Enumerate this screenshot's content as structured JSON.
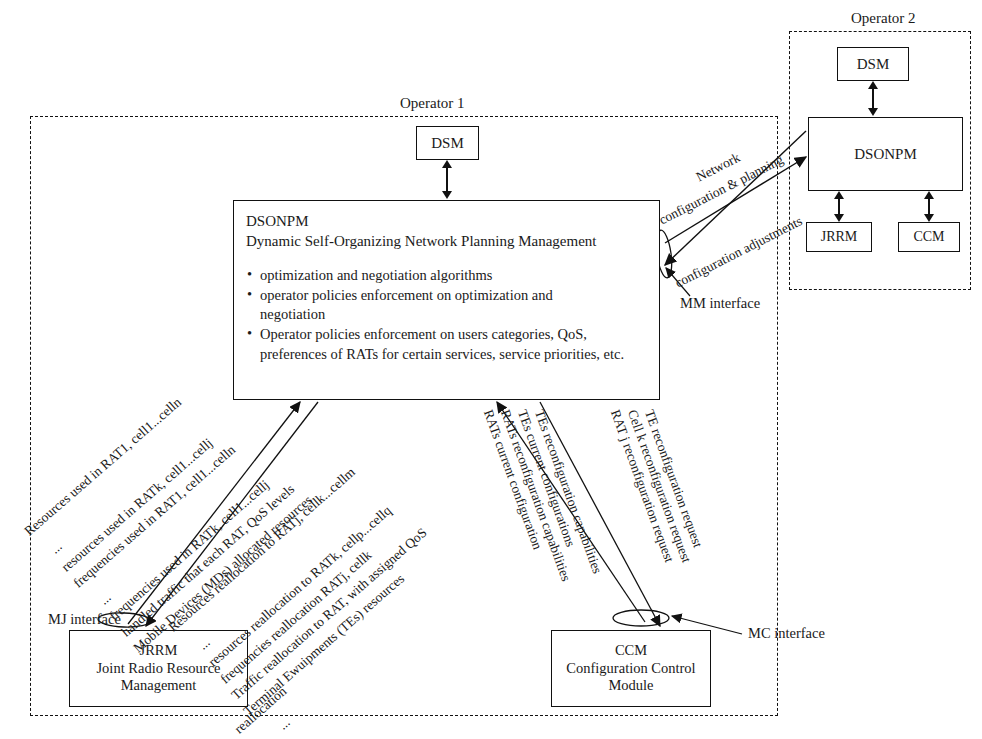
{
  "operators": {
    "op1": {
      "title": "Operator 1"
    },
    "op2": {
      "title": "Operator 2"
    }
  },
  "op1_nodes": {
    "dsm": {
      "label": "DSM"
    },
    "dsonpm": {
      "acronym": "DSONPM",
      "expansion": "Dynamic Self-Organizing Network Planning Management",
      "bullets": [
        {
          "text": "optimization and negotiation algorithms",
          "cont": ""
        },
        {
          "text": "operator policies enforcement on optimization and",
          "cont": "negotiation"
        },
        {
          "text": "Operator policies enforcement on users categories, QoS,",
          "cont": "preferences of RATs for certain services, service priorities, etc."
        }
      ]
    },
    "jrrm": {
      "acronym": "JRRM",
      "line2": "Joint Radio Resource",
      "line3": "Management"
    },
    "ccm": {
      "acronym": "CCM",
      "line2": "Configuration Control",
      "line3": "Module"
    }
  },
  "op2_nodes": {
    "dsm": {
      "label": "DSM"
    },
    "dsonpm": {
      "label": "DSONPM"
    },
    "jrrm": {
      "label": "JRRM"
    },
    "ccm": {
      "label": "CCM"
    }
  },
  "interfaces": {
    "mj": "MJ interface",
    "mc": "MC interface",
    "mm": "MM interface"
  },
  "inter_operator": {
    "up_line1": "Network",
    "up_line2": "configuration & planning",
    "down": "configuration adjustments"
  },
  "jrrm_up_labels": [
    "Resources used in RAT1, cell1...celln",
    "...",
    "resources used in RATk, cell1...cellj",
    "frequencies used in RAT1, cell1...celln",
    "...",
    "frequencies used in RATk, cell1...cellj",
    "handled traffic that each RAT, QoS levels",
    "Mobile Devices (MDs) allocated resources"
  ],
  "jrrm_down_labels": [
    "Resources reallocation to RATj, cellk...cellm",
    "...",
    "resources reallocation to RATk, cellp...cellq",
    "frequencies reallocation RATj, cellk",
    "Traffic reallocation to RAT, with assigned QoS",
    "Terminal Ewuipments (TEs) resources",
    "reallocation",
    "..."
  ],
  "ccm_up_labels": [
    "RATs current configuration",
    "RATs reconfiguration capabilities",
    "TEs current configurations",
    "TEs reconfiguration capabilities"
  ],
  "ccm_down_labels": [
    "RAT j reconfiguration request",
    "Cell k reconfiguration request",
    "TE reconfiguration request"
  ],
  "colors": {
    "ink": "#111111",
    "background": "#ffffff"
  }
}
